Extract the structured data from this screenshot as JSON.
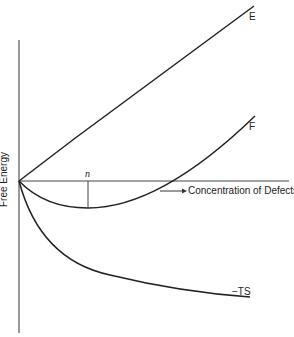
{
  "diagram": {
    "y_axis_label": "Free Energy",
    "x_axis_label": "Concentration of Defects",
    "curves": [
      {
        "name": "E",
        "label": "E",
        "description": "energy rises linearly with defect concentration"
      },
      {
        "name": "F",
        "label": "F",
        "description": "free energy, minimum at n"
      },
      {
        "name": "-TS",
        "label": "−TS",
        "description": "entropy term, decreasing"
      }
    ],
    "minimum_marker": "n",
    "colors": {
      "line": "#222222",
      "background": "#ffffff"
    }
  }
}
